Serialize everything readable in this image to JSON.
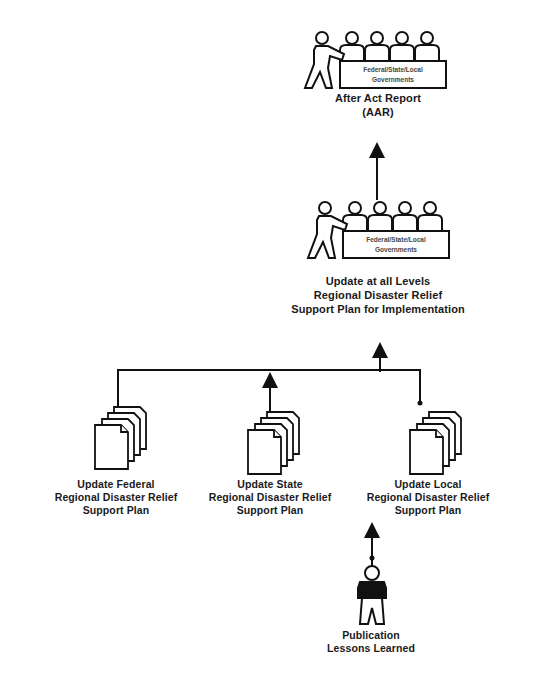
{
  "diagram": {
    "nodes": {
      "aar": {
        "table_text": [
          "Federal/State/Local",
          "Governments"
        ],
        "label": [
          "After Act Report",
          "(AAR)"
        ]
      },
      "update_all": {
        "table_text": [
          "Federal/State/Local",
          "Governments"
        ],
        "label": [
          "Update at all Levels",
          "Regional Disaster Relief",
          "Support Plan for Implementation"
        ]
      },
      "federal": {
        "label": [
          "Update Federal",
          "Regional Disaster Relief",
          "Support Plan"
        ]
      },
      "state": {
        "label": [
          "Update State",
          "Regional Disaster Relief",
          "Support Plan"
        ]
      },
      "local": {
        "label": [
          "Update Local",
          "Regional Disaster Relief",
          "Support Plan"
        ]
      },
      "publication": {
        "label": [
          "Publication",
          "Lessons Learned"
        ]
      }
    },
    "icons": {
      "meeting": "meeting-table-icon",
      "documents": "document-stack-icon",
      "person": "person-icon"
    },
    "colors": {
      "stroke": "#111111",
      "background": "#ffffff"
    }
  }
}
